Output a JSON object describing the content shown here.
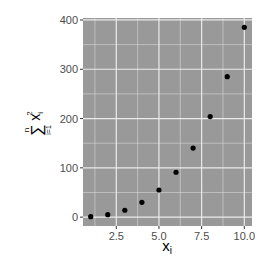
{
  "chart_data": {
    "type": "scatter",
    "title": "",
    "xlabel": "x_i",
    "ylabel": "sum_{i=1}^{n} x_i^2",
    "x": [
      1,
      2,
      3,
      4,
      5,
      6,
      7,
      8,
      9,
      10
    ],
    "y": [
      1,
      5,
      14,
      30,
      55,
      91,
      140,
      204,
      285,
      385
    ],
    "xlim": [
      0.55,
      10.45
    ],
    "ylim": [
      -18,
      404
    ],
    "x_ticks": [
      2.5,
      5.0,
      7.5,
      10.0
    ],
    "x_tick_labels": [
      "2.5",
      "5.0",
      "7.5",
      "10.0"
    ],
    "y_ticks": [
      0,
      100,
      200,
      300,
      400
    ],
    "y_tick_labels": [
      "0",
      "100",
      "200",
      "300",
      "400"
    ],
    "grid": true,
    "legend": null,
    "colors": {
      "panel_background": "#999999",
      "grid_major": "#ebebeb",
      "grid_minor": "#d9d9d9",
      "point": "#000000",
      "tick_text": "#4d4d4d",
      "tick_mark": "#333333"
    }
  },
  "labels": {
    "x_axis_main": "x",
    "x_axis_sub": "i",
    "y_axis_sum_symbol": "∑",
    "y_axis_sum_upper": "n",
    "y_axis_sum_lower": "i=1",
    "y_axis_var": "x",
    "y_axis_var_sub": "i",
    "y_axis_var_sup": "2"
  }
}
